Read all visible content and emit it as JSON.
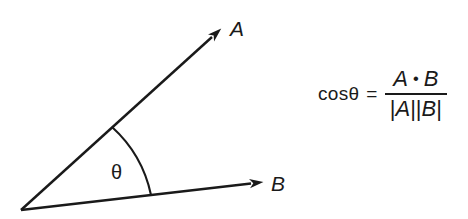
{
  "diagram": {
    "vector_a_label": "A",
    "vector_b_label": "B",
    "angle_label": "θ"
  },
  "formula": {
    "lhs": "cosθ",
    "equals": "=",
    "numerator": {
      "a": "A",
      "dot": "•",
      "b": "B"
    },
    "denominator": {
      "open_bar": "|",
      "a": "A",
      "double_bar": "||",
      "b": "B",
      "close_bar": "|"
    }
  },
  "colors": {
    "ink": "#1a1a1a",
    "background": "#ffffff"
  }
}
